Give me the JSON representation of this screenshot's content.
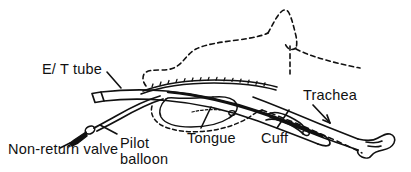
{
  "figure": {
    "type": "line-diagram",
    "background_color": "#ffffff",
    "ink_color": "#111111",
    "style": "black-and-white pen line drawing; head/tongue profile drawn with dashed lines, tube and trachea with solid lines",
    "width": 411,
    "height": 172
  },
  "labels": [
    {
      "id": "et-tube",
      "text": "E/ T tube",
      "x": 42,
      "y": 62,
      "leader": "short diagonal line from label down-right to the proximal tube connector"
    },
    {
      "id": "non-return-valve",
      "text": "Non-return valve",
      "x": 8,
      "y": 142,
      "leader": "diagonal line up-right to the small solid black wedge on the pilot tube"
    },
    {
      "id": "pilot-balloon",
      "text_line1": "Pilot",
      "text_line2": "balloon",
      "x": 120,
      "y": 136,
      "leader": "short diagonal line up-left to the small oval pilot balloon"
    },
    {
      "id": "tongue",
      "text": "Tongue",
      "x": 187,
      "y": 131,
      "leader": "vertical line up to the tongue outline"
    },
    {
      "id": "cuff",
      "text": "Cuff",
      "x": 261,
      "y": 131,
      "leader": "short diagonal line up-right to the inflated cuff on the tube"
    },
    {
      "id": "trachea",
      "text": "Trachea",
      "x": 303,
      "y": 88,
      "leader": "arrow pointing down-left into the tracheal lumen"
    }
  ],
  "parts": [
    {
      "name": "head-profile",
      "stroke": "dashed",
      "note": "lips, nose peak and nostril of the sagittal head outline"
    },
    {
      "name": "tongue-outline",
      "stroke": "dashed-and-solid",
      "note": "closed loop under the palate"
    },
    {
      "name": "palate-line",
      "stroke": "solid",
      "note": "hatched roof of the mouth"
    },
    {
      "name": "endotracheal-tube",
      "stroke": "solid",
      "note": "curved tube from connector at upper-left down into the trachea"
    },
    {
      "name": "tube-connector",
      "stroke": "solid",
      "note": "open rectangle at the proximal end of the tube"
    },
    {
      "name": "pilot-tube",
      "stroke": "solid",
      "note": "thin line branching down-left from the main tube"
    },
    {
      "name": "pilot-balloon",
      "stroke": "solid",
      "note": "small oval on the pilot tube"
    },
    {
      "name": "non-return-valve",
      "stroke": "solid-filled",
      "note": "small solid black wedge at the end of the pilot tube"
    },
    {
      "name": "cuff",
      "stroke": "solid",
      "note": "inflated collar around the distal tube"
    },
    {
      "name": "trachea-outline",
      "stroke": "solid",
      "note": "two near-parallel lines running down-right with irregular cartilage tip"
    },
    {
      "name": "oesophagus-line",
      "stroke": "dashed",
      "note": "dashed line below the trachea"
    }
  ]
}
